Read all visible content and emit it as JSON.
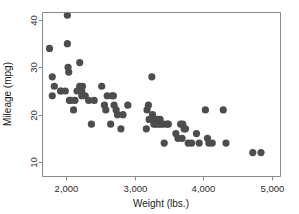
{
  "chart_data": {
    "type": "scatter",
    "title": "",
    "xlabel": "Weight (lbs.)",
    "ylabel": "Mileage (mpg)",
    "xlim": [
      1650,
      4900
    ],
    "ylim": [
      9,
      42
    ],
    "grid": false,
    "legend": null,
    "marker": {
      "shape": "circle",
      "color": "#4d4d4d",
      "size_px": 4.6
    },
    "xticks": [
      2000,
      3000,
      4000,
      5000
    ],
    "xtick_labels": [
      "2,000",
      "3,000",
      "4,000",
      "5,000"
    ],
    "yticks": [
      10,
      20,
      30,
      40
    ],
    "ytick_labels": [
      "10",
      "20",
      "30",
      "40"
    ],
    "n_points": 74,
    "series": [
      {
        "name": "Automobiles",
        "points": [
          [
            1800,
            28
          ],
          [
            1760,
            34
          ],
          [
            1830,
            26
          ],
          [
            1800,
            24
          ],
          [
            1920,
            25
          ],
          [
            1930,
            25
          ],
          [
            1990,
            25
          ],
          [
            2020,
            41
          ],
          [
            2020,
            35
          ],
          [
            2030,
            30
          ],
          [
            2040,
            29
          ],
          [
            2050,
            23
          ],
          [
            2070,
            23
          ],
          [
            2110,
            21
          ],
          [
            2130,
            23
          ],
          [
            2160,
            25
          ],
          [
            2200,
            31
          ],
          [
            2200,
            26
          ],
          [
            2230,
            25
          ],
          [
            2230,
            24
          ],
          [
            2240,
            26
          ],
          [
            2280,
            24
          ],
          [
            2330,
            23
          ],
          [
            2370,
            18
          ],
          [
            2410,
            23
          ],
          [
            2520,
            26
          ],
          [
            2560,
            22
          ],
          [
            2580,
            21
          ],
          [
            2600,
            24
          ],
          [
            2650,
            18
          ],
          [
            2670,
            24
          ],
          [
            2690,
            24
          ],
          [
            2700,
            22
          ],
          [
            2730,
            21
          ],
          [
            2750,
            20
          ],
          [
            2800,
            17
          ],
          [
            2830,
            20
          ],
          [
            2900,
            22
          ],
          [
            3170,
            17
          ],
          [
            3180,
            21
          ],
          [
            3200,
            22
          ],
          [
            3210,
            19
          ],
          [
            3250,
            28
          ],
          [
            3260,
            20
          ],
          [
            3280,
            19
          ],
          [
            3280,
            18
          ],
          [
            3300,
            19
          ],
          [
            3310,
            18
          ],
          [
            3330,
            19
          ],
          [
            3350,
            18
          ],
          [
            3370,
            19
          ],
          [
            3380,
            18
          ],
          [
            3420,
            18
          ],
          [
            3430,
            14
          ],
          [
            3470,
            18
          ],
          [
            3490,
            18
          ],
          [
            3600,
            16
          ],
          [
            3630,
            15
          ],
          [
            3670,
            18
          ],
          [
            3690,
            15
          ],
          [
            3700,
            18
          ],
          [
            3720,
            17
          ],
          [
            3740,
            17
          ],
          [
            3780,
            14
          ],
          [
            3830,
            14
          ],
          [
            3900,
            16
          ],
          [
            3940,
            14
          ],
          [
            4030,
            21
          ],
          [
            4060,
            15
          ],
          [
            4080,
            14
          ],
          [
            4130,
            14
          ],
          [
            4290,
            21
          ],
          [
            4330,
            14
          ],
          [
            4720,
            12
          ],
          [
            4840,
            12
          ]
        ]
      }
    ]
  },
  "axes": {
    "x_title": "Weight (lbs.)",
    "y_title": "Mileage (mpg)"
  }
}
